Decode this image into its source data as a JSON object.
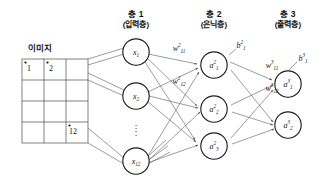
{
  "figure": {
    "type": "neural-network-diagram",
    "language": "ko",
    "background": "#ffffff",
    "stroke_color": "#4a4a4a",
    "text_color": "#111111"
  },
  "image_block": {
    "caption": "이미지",
    "grid": {
      "columns": 3,
      "rows": 4,
      "total_cells": 12
    },
    "labeled_cells": [
      {
        "index": 1,
        "label": "1",
        "col": 1,
        "row": 1
      },
      {
        "index": 2,
        "label": "2",
        "col": 2,
        "row": 1
      },
      {
        "index": 12,
        "label": "12",
        "col": 3,
        "row": 4
      }
    ]
  },
  "layers": [
    {
      "id": "layer1",
      "title": "층 1",
      "subtitle": "(입력층)",
      "nodes": [
        {
          "id": "x1",
          "base": "x",
          "sub": "1",
          "sup": ""
        },
        {
          "id": "x2",
          "base": "x",
          "sub": "2",
          "sup": ""
        },
        {
          "id": "x12",
          "base": "x",
          "sub": "12",
          "sup": ""
        }
      ],
      "ellipsis": true
    },
    {
      "id": "layer2",
      "title": "층 2",
      "subtitle": "(은닉층)",
      "nodes": [
        {
          "id": "a2_1",
          "base": "a",
          "sub": "1",
          "sup": "2"
        },
        {
          "id": "a2_2",
          "base": "a",
          "sub": "2",
          "sup": "2"
        },
        {
          "id": "a2_3",
          "base": "a",
          "sub": "3",
          "sup": "2"
        }
      ],
      "ellipsis": false,
      "bias": {
        "id": "b2_1",
        "base": "b",
        "sub": "1",
        "sup": "2"
      }
    },
    {
      "id": "layer3",
      "title": "층 3",
      "subtitle": "(출력층)",
      "nodes": [
        {
          "id": "a3_1",
          "base": "a",
          "sub": "1",
          "sup": "3"
        },
        {
          "id": "a3_2",
          "base": "a",
          "sub": "2",
          "sup": "3"
        }
      ],
      "ellipsis": false,
      "bias": {
        "id": "b3_1",
        "base": "b",
        "sub": "1",
        "sup": "3"
      }
    }
  ],
  "weights": [
    {
      "id": "w2_11",
      "base": "w",
      "sub": "11",
      "sup": "2"
    },
    {
      "id": "w2_12",
      "base": "w",
      "sub": "12",
      "sup": "2"
    },
    {
      "id": "w3_11",
      "base": "w",
      "sub": "11",
      "sup": "3"
    },
    {
      "id": "w3_12",
      "base": "w",
      "sub": "12",
      "sup": "3"
    }
  ]
}
